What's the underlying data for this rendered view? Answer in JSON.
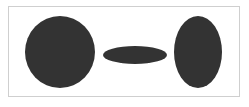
{
  "diagram": {
    "background": "#ffffff",
    "border_color": "#cfcfcf",
    "shapes": [
      {
        "id": "circle",
        "type": "ellipse",
        "cx": 60,
        "cy": 52,
        "rx": 35,
        "ry": 36,
        "fill": "#333333"
      },
      {
        "id": "flat-ellipse",
        "type": "ellipse",
        "cx": 135,
        "cy": 55,
        "rx": 32,
        "ry": 9,
        "fill": "#333333"
      },
      {
        "id": "tall-ellipse",
        "type": "ellipse",
        "cx": 198,
        "cy": 52,
        "rx": 24,
        "ry": 36,
        "fill": "#333333"
      }
    ]
  }
}
